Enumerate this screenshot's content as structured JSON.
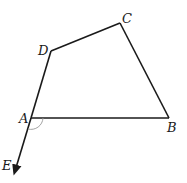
{
  "diagram": {
    "type": "geometry",
    "points": {
      "A": {
        "label": "A",
        "x": 31,
        "y": 118
      },
      "B": {
        "label": "B",
        "x": 169,
        "y": 118
      },
      "C": {
        "label": "C",
        "x": 120,
        "y": 23
      },
      "D": {
        "label": "D",
        "x": 51,
        "y": 51
      },
      "E": {
        "label": "E",
        "x": 14,
        "y": 175
      }
    },
    "segments": [
      "AB",
      "BC",
      "CD",
      "DA",
      "AE"
    ],
    "ray": {
      "from": "D",
      "through": "A",
      "to": "E",
      "arrow": true
    },
    "angle_mark": {
      "vertex": "A",
      "between": [
        "B",
        "E"
      ]
    },
    "colors": {
      "line": "#1a1a1a",
      "angle_mark": "#999999"
    }
  }
}
